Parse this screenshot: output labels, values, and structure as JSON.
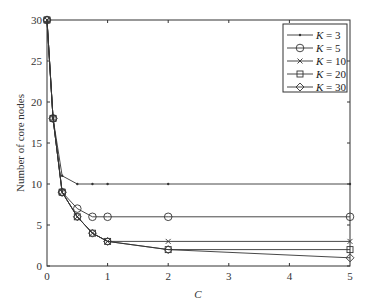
{
  "chart_data": {
    "type": "line",
    "title": "",
    "xlabel": "C",
    "ylabel": "Number of core nodes",
    "xlim": [
      0,
      5
    ],
    "ylim": [
      0,
      30
    ],
    "xticks": [
      0,
      1,
      2,
      3,
      4,
      5
    ],
    "yticks": [
      0,
      5,
      10,
      15,
      20,
      25,
      30
    ],
    "grid": false,
    "legend_position": "upper right",
    "x": [
      0,
      0.1,
      0.25,
      0.5,
      0.75,
      1,
      2,
      5
    ],
    "series": [
      {
        "name": "K = 3",
        "marker": "dot",
        "values": [
          30,
          18,
          11,
          10,
          10,
          10,
          10,
          10
        ]
      },
      {
        "name": "K = 5",
        "marker": "circle",
        "values": [
          30,
          18,
          9,
          7,
          6,
          6,
          6,
          6
        ]
      },
      {
        "name": "K = 10",
        "marker": "x",
        "values": [
          30,
          18,
          9,
          6,
          4,
          3,
          3,
          3
        ]
      },
      {
        "name": "K = 20",
        "marker": "square",
        "values": [
          30,
          18,
          9,
          6,
          4,
          3,
          2,
          2
        ]
      },
      {
        "name": "K = 30",
        "marker": "diamond",
        "values": [
          30,
          18,
          9,
          6,
          4,
          3,
          2,
          1
        ]
      }
    ]
  },
  "legend": {
    "items": [
      {
        "k": "K",
        "eq": " = 3"
      },
      {
        "k": "K",
        "eq": " = 5"
      },
      {
        "k": "K",
        "eq": " = 10"
      },
      {
        "k": "K",
        "eq": " = 20"
      },
      {
        "k": "K",
        "eq": " = 30"
      }
    ]
  },
  "axes": {
    "x_label": "C",
    "y_label": "Number of core nodes",
    "x_ticks": [
      "0",
      "1",
      "2",
      "3",
      "4",
      "5"
    ],
    "y_ticks": [
      "0",
      "5",
      "10",
      "15",
      "20",
      "25",
      "30"
    ]
  },
  "colors": {
    "line": "#333333",
    "axis": "#333333"
  }
}
